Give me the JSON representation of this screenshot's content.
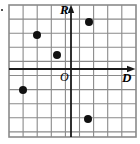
{
  "figure": {
    "name": "coordinate-grid-plot",
    "background_color": "#ffffff",
    "grid": {
      "left": 9,
      "top": 5,
      "right": 136,
      "bottom": 137,
      "cell_size": 14.1,
      "columns": 9,
      "rows": 9,
      "line_color": "#8a8a8a",
      "line_width": 1.1,
      "border_color": "#8a8a8a",
      "border_width": 1.6
    },
    "axes": {
      "color": "#1a1a1a",
      "line_width": 1.8,
      "origin_x": 71,
      "origin_y": 69,
      "vertical": {
        "label": "R",
        "direction": "up",
        "arrow": true,
        "x": 71,
        "top": 5,
        "bottom": 137
      },
      "horizontal": {
        "label": "D",
        "direction": "right",
        "arrow": true,
        "y": 69,
        "left": 9,
        "right": 136
      },
      "origin_label": "O"
    },
    "points": {
      "color": "#111111",
      "radius": 4.0,
      "count": 6,
      "items": [
        {
          "name": "point-1",
          "px": 37,
          "py": 35,
          "gx": -2.5,
          "gy": 2.5
        },
        {
          "name": "point-2",
          "px": 57,
          "py": 55,
          "gx": -1.0,
          "gy": 1.0
        },
        {
          "name": "point-3",
          "px": 89,
          "py": 22,
          "gx": 1.3,
          "gy": 3.3
        },
        {
          "name": "point-4",
          "px": 23,
          "py": 90,
          "gx": -3.4,
          "gy": -1.5
        },
        {
          "name": "point-5",
          "px": 88,
          "py": 119,
          "gx": 1.2,
          "gy": -3.5
        }
      ]
    },
    "marks": {
      "corner_speck": "·"
    }
  }
}
